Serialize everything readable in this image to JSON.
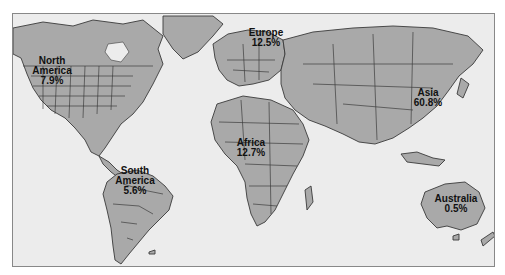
{
  "map": {
    "type": "world-continent-share",
    "colors": {
      "land": "#a9a9a9",
      "ocean": "#ececec",
      "border": "#3a3a3a",
      "frame": "#888888"
    },
    "regions": [
      {
        "name": "North America",
        "value": "7.9%",
        "label": "North\nAmerica\n7.9%"
      },
      {
        "name": "Europe",
        "value": "12.5%",
        "label": "Europe\n12.5%"
      },
      {
        "name": "Asia",
        "value": "60.8%",
        "label": "Asia\n60.8%"
      },
      {
        "name": "Africa",
        "value": "12.7%",
        "label": "Africa\n12.7%"
      },
      {
        "name": "South America",
        "value": "5.6%",
        "label": "South\nAmerica\n5.6%"
      },
      {
        "name": "Australia",
        "value": "0.5%",
        "label": "Australia\n0.5%"
      }
    ]
  }
}
